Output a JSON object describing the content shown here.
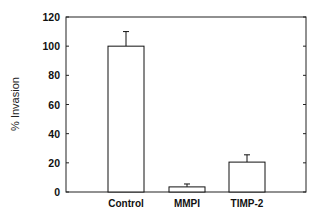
{
  "chart_data": {
    "type": "bar",
    "title": "",
    "xlabel": "",
    "ylabel": "% Invasion",
    "categories": [
      "Control",
      "MMPI",
      "TIMP-2"
    ],
    "values": [
      100,
      3.5,
      20.5
    ],
    "error_bars": [
      10,
      2,
      5
    ],
    "ylim": [
      0,
      120
    ],
    "yticks": [
      0,
      20,
      40,
      60,
      80,
      100,
      120
    ],
    "grid": false,
    "legend": null,
    "bar_fill": "#ffffff",
    "bar_stroke": "#111111"
  }
}
